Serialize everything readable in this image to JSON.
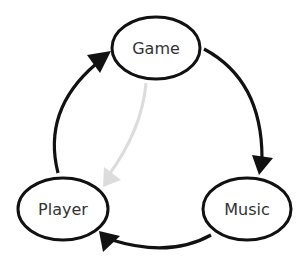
{
  "diagram": {
    "type": "cycle",
    "colors": {
      "stroke": "#111111",
      "text": "#333333",
      "faded_edge": "#dcdcdc",
      "background": "#ffffff"
    },
    "nodes": [
      {
        "id": "game",
        "label": "Game",
        "cx": 156,
        "cy": 48,
        "rx": 44,
        "ry": 31
      },
      {
        "id": "music",
        "label": "Music",
        "cx": 247,
        "cy": 209,
        "rx": 44,
        "ry": 31
      },
      {
        "id": "player",
        "label": "Player",
        "cx": 63,
        "cy": 209,
        "rx": 45,
        "ry": 31
      }
    ],
    "edges": [
      {
        "from": "Game",
        "to": "Music",
        "style": "solid-dark"
      },
      {
        "from": "Music",
        "to": "Player",
        "style": "solid-dark"
      },
      {
        "from": "Player",
        "to": "Game",
        "style": "solid-dark"
      },
      {
        "from": "Game",
        "to": "Player",
        "style": "faded-grey"
      }
    ]
  }
}
